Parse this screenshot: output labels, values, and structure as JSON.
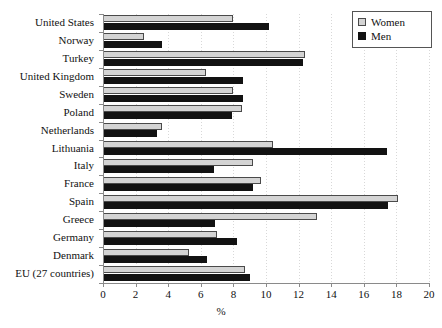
{
  "chart_data": {
    "type": "bar",
    "orientation": "horizontal",
    "title": "",
    "xlabel": "%",
    "ylabel": "",
    "xlim": [
      0,
      20
    ],
    "xticks": [
      0,
      2,
      4,
      6,
      8,
      10,
      12,
      14,
      16,
      18,
      20
    ],
    "grid": true,
    "legend_position": "top-right",
    "categories": [
      "United States",
      "Norway",
      "Turkey",
      "United Kingdom",
      "Sweden",
      "Poland",
      "Netherlands",
      "Lithuania",
      "Italy",
      "France",
      "Spain",
      "Greece",
      "Germany",
      "Denmark",
      "EU (27 countries)"
    ],
    "series": [
      {
        "name": "Women",
        "color": "#d4d4d4",
        "values": [
          8.0,
          2.5,
          12.4,
          6.3,
          8.0,
          8.5,
          3.6,
          10.4,
          9.2,
          9.7,
          18.1,
          13.1,
          7.0,
          5.3,
          8.7
        ]
      },
      {
        "name": "Men",
        "color": "#121212",
        "values": [
          10.2,
          3.6,
          12.3,
          8.6,
          8.6,
          7.9,
          3.3,
          17.4,
          6.8,
          9.2,
          17.5,
          6.9,
          8.2,
          6.4,
          9.0
        ]
      }
    ]
  },
  "legend": {
    "items": [
      {
        "label": "Women"
      },
      {
        "label": "Men"
      }
    ]
  }
}
